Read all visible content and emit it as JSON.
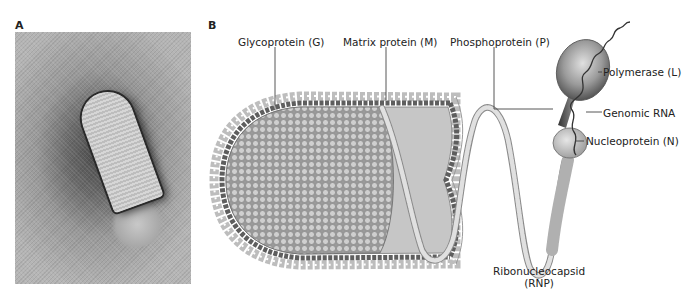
{
  "panels": {
    "a": {
      "label": "A",
      "content": "electron micrograph of bullet-shaped virion"
    },
    "b": {
      "label": "B",
      "content": "schematic of bullet-shaped virus particle with extended ribonucleocapsid"
    }
  },
  "labels": {
    "glycoprotein": "Glycoprotein (G)",
    "matrix": "Matrix protein (M)",
    "phosphoprotein": "Phosphoprotein (P)",
    "polymerase": "Polymerase (L)",
    "genomic_rna": "Genomic RNA",
    "nucleoprotein": "Nucleoprotein (N)",
    "rnp_line1": "Ribonucleocapsid",
    "rnp_line2": "(RNP)"
  },
  "colors": {
    "envelope_bead": "#c9c9c9",
    "matrix_bead": "#5a5a5a",
    "interior": "#c8c8c8",
    "rnp_bead": "#d4d4d4",
    "leader_line": "#444444"
  }
}
